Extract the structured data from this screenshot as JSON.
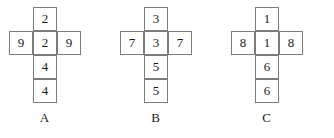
{
  "figure": {
    "background_color": "#ffffff",
    "border_color": "#7c7c7c",
    "text_color": "#1a1a1a",
    "nets": [
      {
        "label": "A",
        "column": [
          "2",
          "2",
          "4",
          "4"
        ],
        "wing_left": "9",
        "wing_right": "9",
        "wing_row_index": 1
      },
      {
        "label": "B",
        "column": [
          "3",
          "3",
          "5",
          "5"
        ],
        "wing_left": "7",
        "wing_right": "7",
        "wing_row_index": 1
      },
      {
        "label": "C",
        "column": [
          "1",
          "1",
          "6",
          "6"
        ],
        "wing_left": "8",
        "wing_right": "8",
        "wing_row_index": 1
      }
    ]
  }
}
